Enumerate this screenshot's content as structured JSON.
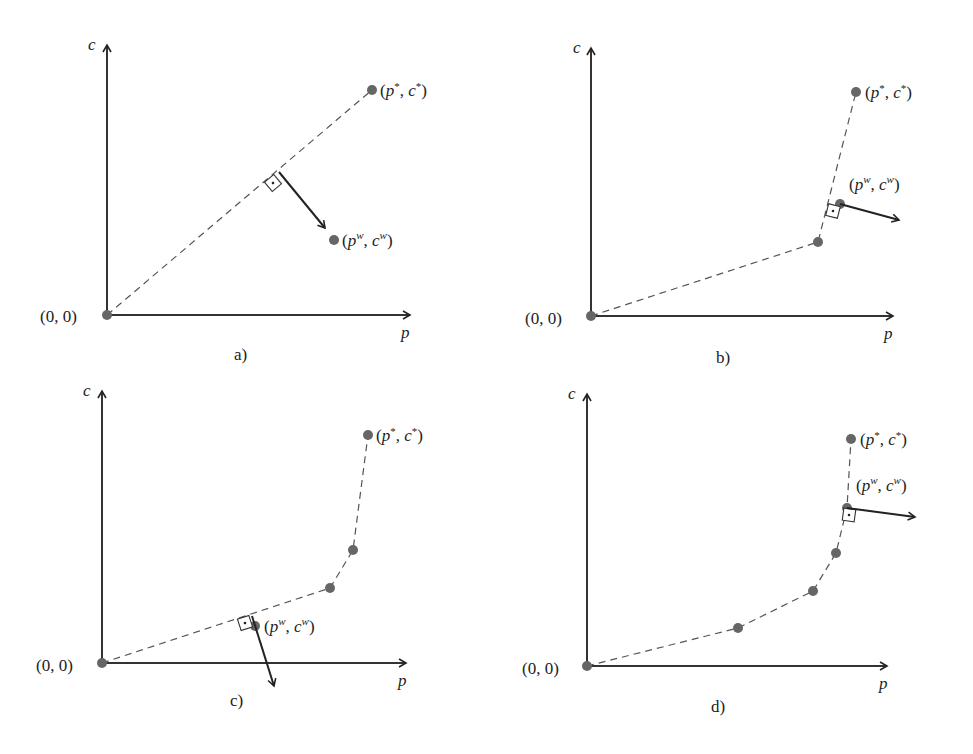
{
  "figure": {
    "panels": [
      {
        "caption": "a)",
        "x_axis_label": "p",
        "y_axis_label": "c",
        "origin_label": "(0, 0)",
        "target_label": "(p*, c*)",
        "weight_label": "(p^w, c^w)",
        "path": "straight dashed line from origin to target"
      },
      {
        "caption": "b)",
        "x_axis_label": "p",
        "y_axis_label": "c",
        "origin_label": "(0, 0)",
        "target_label": "(p*, c*)",
        "weight_label": "(p^w, c^w)",
        "path": "piecewise dashed line with 1 intermediate point"
      },
      {
        "caption": "c)",
        "x_axis_label": "p",
        "y_axis_label": "c",
        "origin_label": "(0, 0)",
        "target_label": "(p*, c*)",
        "weight_label": "(p^w, c^w)",
        "path": "piecewise dashed line with 2 intermediate points"
      },
      {
        "caption": "d)",
        "x_axis_label": "p",
        "y_axis_label": "c",
        "origin_label": "(0, 0)",
        "target_label": "(p*, c*)",
        "weight_label": "(p^w, c^w)",
        "path": "piecewise dashed line with 3 intermediate points"
      }
    ]
  },
  "labels": {
    "p": "p",
    "c": "c",
    "origin": "(0, 0)",
    "star_open": "(",
    "star_p": "p",
    "star_sup": "*",
    "comma": ", ",
    "star_c": "c",
    "close": ")",
    "w_p": "p",
    "w_sup": "w",
    "w_c": "c"
  }
}
